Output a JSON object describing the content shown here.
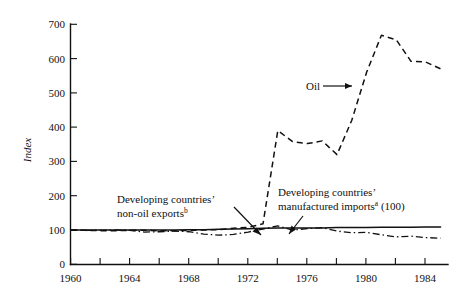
{
  "chart_data": {
    "type": "line",
    "title": "",
    "subtitle": "",
    "xlabel": "",
    "ylabel": "Index",
    "xlim": [
      1960,
      1985.5
    ],
    "ylim": [
      0,
      700
    ],
    "grid": false,
    "legend_position": "inline-annotations",
    "y_ticks": [
      0,
      100,
      200,
      300,
      400,
      500,
      600,
      700
    ],
    "y_tick_labels": [
      "0",
      "100",
      "200",
      "300",
      "400",
      "500",
      "600",
      "700"
    ],
    "x_ticks": [
      1960,
      1962,
      1964,
      1966,
      1968,
      1970,
      1972,
      1974,
      1976,
      1978,
      1980,
      1982,
      1984
    ],
    "x_tick_labels": [
      "1960",
      "",
      "1964",
      "",
      "1968",
      "",
      "1972",
      "",
      "1976",
      "",
      "1980",
      "",
      "1984"
    ],
    "x_major_labels": [
      "1960",
      "1964",
      "1968",
      "1972",
      "1976",
      "1980",
      "1984"
    ],
    "x": [
      1960,
      1961,
      1962,
      1963,
      1964,
      1965,
      1966,
      1967,
      1968,
      1969,
      1970,
      1971,
      1972,
      1973,
      1974,
      1975,
      1976,
      1977,
      1978,
      1979,
      1980,
      1981,
      1982,
      1983,
      1984,
      1985
    ],
    "series": [
      {
        "name": "Oil",
        "style": "dashed",
        "values": [
          100,
          99,
          98,
          98,
          99,
          99,
          98,
          98,
          99,
          100,
          101,
          105,
          108,
          118,
          390,
          358,
          352,
          360,
          320,
          420,
          560,
          668,
          655,
          592,
          590,
          570
        ]
      },
      {
        "name": "Developing countries' non-oil exports",
        "style": "dash-dot",
        "values": [
          100,
          99,
          99,
          100,
          99,
          94,
          95,
          97,
          95,
          88,
          85,
          87,
          94,
          103,
          112,
          100,
          104,
          107,
          97,
          92,
          93,
          86,
          80,
          82,
          78,
          76
        ]
      },
      {
        "name": "Developing countries' manufactured imports",
        "style": "solid",
        "values": [
          100,
          100,
          100,
          100,
          100,
          100,
          100,
          100,
          101,
          101,
          102,
          103,
          104,
          105,
          106,
          106,
          106,
          106,
          107,
          107,
          107,
          108,
          108,
          108,
          109,
          109
        ]
      }
    ],
    "annotations": [
      {
        "name": "oil-label",
        "text": "Oil",
        "superscript": "",
        "suffix": ""
      },
      {
        "name": "non-oil-exports-label",
        "line1": "Developing countries’",
        "line2": "non-oil exports",
        "superscript": "b",
        "suffix": ""
      },
      {
        "name": "manufactured-imports-label",
        "line1": "Developing countries’",
        "line2": "manufactured imports",
        "superscript": "a",
        "suffix": " (100)"
      }
    ],
    "colors": {
      "ink": "#111111",
      "background": "#ffffff"
    }
  }
}
